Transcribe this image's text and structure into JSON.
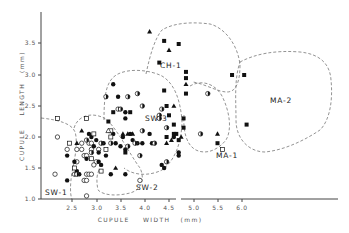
{
  "chart_data": {
    "type": "scatter",
    "title": "",
    "xlabel": "CUPULE WIDTH (mm)",
    "ylabel": "CUPULE LENGTH (mm)",
    "xlim": [
      2.1,
      6.8
    ],
    "ylim": [
      1.0,
      3.9
    ],
    "x_ticks": [
      "2.5",
      "3.0",
      "3.5",
      "4.0",
      "4.5",
      "5.0",
      "5.5",
      "6.0"
    ],
    "y_ticks": [
      "1.0",
      "1.5",
      "2.0",
      "2.5",
      "3.0",
      "3.5"
    ],
    "axis_break": "x-axis broken between 4.5 and 5.0",
    "grid": false,
    "legend": null,
    "marker_types": [
      "open-circle",
      "filled-circle",
      "half-filled-circle",
      "open-square",
      "filled-square",
      "filled-triangle",
      "open-triangle"
    ],
    "regions": [
      {
        "name": "SW-1",
        "label": "SW-1"
      },
      {
        "name": "SW-2",
        "label": "SW-2"
      },
      {
        "name": "SW-3",
        "label": "SW-3"
      },
      {
        "name": "CH-1",
        "label": "CH-1"
      },
      {
        "name": "MA-1",
        "label": "MA-1"
      },
      {
        "name": "MA-2",
        "label": "MA-2"
      }
    ],
    "series": [
      {
        "name": "open-circle",
        "points": [
          [
            2.15,
            1.4
          ],
          [
            2.2,
            2.0
          ],
          [
            2.4,
            1.8
          ],
          [
            2.6,
            1.6
          ],
          [
            2.75,
            1.3
          ],
          [
            2.8,
            1.3
          ],
          [
            2.8,
            1.05
          ],
          [
            2.8,
            1.4
          ],
          [
            2.85,
            1.4
          ],
          [
            2.9,
            1.4
          ],
          [
            2.6,
            1.8
          ],
          [
            2.7,
            1.8
          ],
          [
            2.75,
            1.7
          ],
          [
            2.8,
            1.7
          ],
          [
            2.85,
            1.9
          ],
          [
            2.9,
            1.9
          ],
          [
            3.0,
            1.6
          ],
          [
            2.95,
            1.55
          ],
          [
            3.9,
            1.3
          ],
          [
            2.7,
            1.9
          ],
          [
            2.9,
            1.8
          ],
          [
            3.05,
            1.8
          ]
        ]
      },
      {
        "name": "filled-circle",
        "points": [
          [
            2.4,
            1.3
          ],
          [
            2.4,
            1.7
          ],
          [
            2.55,
            1.6
          ],
          [
            2.6,
            1.45
          ],
          [
            2.65,
            1.4
          ],
          [
            2.8,
            1.65
          ],
          [
            2.85,
            2.05
          ],
          [
            2.9,
            2.0
          ],
          [
            2.95,
            1.85
          ],
          [
            3.0,
            1.95
          ],
          [
            3.05,
            1.75
          ],
          [
            3.05,
            1.6
          ],
          [
            3.1,
            1.55
          ],
          [
            3.15,
            1.9
          ],
          [
            3.2,
            1.7
          ],
          [
            3.3,
            1.4
          ],
          [
            3.6,
            1.4
          ],
          [
            3.35,
            2.05
          ],
          [
            3.4,
            1.9
          ],
          [
            3.5,
            1.85
          ],
          [
            3.55,
            2.0
          ],
          [
            3.6,
            1.8
          ],
          [
            3.7,
            2.05
          ],
          [
            3.75,
            1.95
          ],
          [
            3.85,
            1.9
          ],
          [
            3.95,
            1.9
          ],
          [
            3.35,
            2.85
          ],
          [
            3.45,
            2.65
          ],
          [
            3.6,
            2.4
          ],
          [
            3.6,
            2.3
          ],
          [
            4.1,
            2.05
          ],
          [
            4.15,
            1.9
          ],
          [
            4.35,
            1.55
          ],
          [
            4.4,
            1.5
          ],
          [
            4.6,
            2.0
          ],
          [
            4.7,
            1.75
          ],
          [
            4.7,
            1.7
          ]
        ]
      },
      {
        "name": "half-filled-circle",
        "points": [
          [
            2.55,
            1.4
          ],
          [
            2.6,
            1.4
          ],
          [
            2.8,
            1.95
          ],
          [
            2.9,
            1.75
          ],
          [
            3.1,
            1.9
          ],
          [
            3.2,
            2.65
          ],
          [
            3.3,
            1.9
          ],
          [
            3.45,
            2.45
          ],
          [
            3.5,
            2.45
          ],
          [
            3.65,
            2.65
          ],
          [
            3.85,
            2.7
          ],
          [
            3.95,
            2.5
          ],
          [
            3.9,
            1.7
          ],
          [
            3.95,
            2.1
          ],
          [
            4.2,
            1.9
          ],
          [
            4.3,
            2.35
          ],
          [
            4.35,
            2.45
          ],
          [
            4.3,
            2.3
          ],
          [
            4.45,
            2.15
          ],
          [
            4.45,
            1.6
          ],
          [
            5.3,
            2.7
          ],
          [
            5.15,
            2.05
          ],
          [
            3.8,
            1.9
          ],
          [
            3.65,
            1.85
          ]
        ]
      },
      {
        "name": "open-square",
        "points": [
          [
            2.2,
            2.3
          ],
          [
            2.45,
            1.9
          ],
          [
            2.55,
            1.5
          ],
          [
            2.8,
            2.3
          ],
          [
            2.9,
            1.65
          ],
          [
            3.1,
            1.45
          ],
          [
            2.95,
            2.05
          ],
          [
            3.3,
            2.1
          ],
          [
            3.3,
            2.0
          ],
          [
            3.2,
            1.8
          ],
          [
            5.6,
            1.8
          ]
        ]
      },
      {
        "name": "filled-square",
        "points": [
          [
            3.25,
            2.25
          ],
          [
            3.35,
            2.4
          ],
          [
            3.7,
            2.4
          ],
          [
            3.6,
            1.75
          ],
          [
            4.4,
            3.55
          ],
          [
            4.3,
            3.2
          ],
          [
            4.7,
            3.5
          ],
          [
            4.85,
            3.05
          ],
          [
            4.85,
            2.95
          ],
          [
            4.85,
            2.7
          ],
          [
            4.4,
            2.75
          ],
          [
            4.45,
            2.5
          ],
          [
            4.5,
            2.35
          ],
          [
            4.6,
            2.2
          ],
          [
            4.65,
            2.05
          ],
          [
            4.8,
            2.3
          ],
          [
            4.8,
            2.15
          ],
          [
            4.7,
            1.95
          ],
          [
            5.5,
            1.9
          ],
          [
            5.8,
            3.0
          ],
          [
            6.05,
            3.0
          ],
          [
            6.1,
            2.2
          ],
          [
            4.45,
            2.0
          ],
          [
            4.6,
            2.05
          ]
        ]
      },
      {
        "name": "filled-triangle",
        "points": [
          [
            4.1,
            3.7
          ],
          [
            4.5,
            3.4
          ],
          [
            4.85,
            2.85
          ],
          [
            3.4,
            1.5
          ],
          [
            3.55,
            2.05
          ],
          [
            3.65,
            2.05
          ],
          [
            3.75,
            2.05
          ],
          [
            4.45,
            1.9
          ],
          [
            4.55,
            1.95
          ],
          [
            4.6,
            2.5
          ],
          [
            4.75,
            2.0
          ],
          [
            5.5,
            2.05
          ],
          [
            2.6,
            1.9
          ],
          [
            2.7,
            2.1
          ]
        ]
      },
      {
        "name": "open-triangle",
        "points": [
          [
            3.25,
            2.1
          ]
        ]
      }
    ]
  },
  "axes": {
    "x_title": "CUPULE    WIDTH   (mm)",
    "y_title": "CUPULE    LENGTH   (mm)",
    "x_ticks": [
      "2.5",
      "3.0",
      "3.5",
      "4.0",
      "4.5",
      "5.0",
      "5.5",
      "6.0"
    ],
    "y_ticks": [
      "1.0",
      "1.5",
      "2.0",
      "2.5",
      "3.0",
      "3.5"
    ]
  },
  "regions": {
    "sw1": "SW-1",
    "sw2": "SW-2",
    "sw3": "SW-3",
    "ch1": "CH-1",
    "ma1": "MA-1",
    "ma2": "MA-2"
  },
  "colors": {
    "ink": "#111111",
    "axis": "#444444",
    "dashed_boundary": "#777777",
    "background": "#ffffff"
  }
}
